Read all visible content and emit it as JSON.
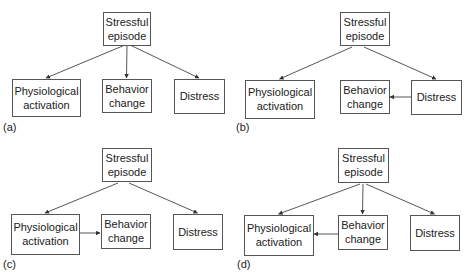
{
  "nodes": {
    "stress": [
      "Stressful",
      "episode"
    ],
    "physio": [
      "Physiological",
      "activation"
    ],
    "behavior": [
      "Behavior",
      "change"
    ],
    "distress": [
      "Distress"
    ]
  },
  "panels": [
    {
      "label": "(a)",
      "edges": [
        [
          "stress",
          "physio"
        ],
        [
          "stress",
          "behavior"
        ],
        [
          "stress",
          "distress"
        ]
      ]
    },
    {
      "label": "(b)",
      "edges": [
        [
          "stress",
          "physio"
        ],
        [
          "stress",
          "distress"
        ],
        [
          "distress",
          "behavior"
        ]
      ]
    },
    {
      "label": "(c)",
      "edges": [
        [
          "stress",
          "physio"
        ],
        [
          "stress",
          "distress"
        ],
        [
          "physio",
          "behavior"
        ]
      ]
    },
    {
      "label": "(d)",
      "edges": [
        [
          "stress",
          "physio"
        ],
        [
          "stress",
          "behavior"
        ],
        [
          "stress",
          "distress"
        ],
        [
          "behavior",
          "physio"
        ]
      ]
    }
  ]
}
